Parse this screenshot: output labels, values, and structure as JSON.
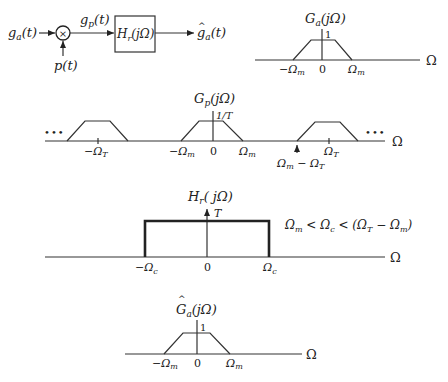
{
  "block_diagram": {
    "input_label": "g",
    "input_sub": "a",
    "input_arg": "(t)",
    "multiplier_symbol": "×",
    "sampling_label": "p(t)",
    "intermediate_label": "g",
    "intermediate_sub": "p",
    "intermediate_arg": "(t)",
    "filter_label": "H",
    "filter_sub": "r",
    "filter_arg": "(jΩ)",
    "output_hat": "^",
    "output_label": "g",
    "output_sub": "a",
    "output_arg": "(t)"
  },
  "spectrum_ga": {
    "title": "G",
    "title_sub": "a",
    "title_arg": "(jΩ)",
    "peak_label": "1",
    "ticks": {
      "neg_label": "−Ω",
      "neg_sub": "m",
      "zero": "0",
      "pos_label": "Ω",
      "pos_sub": "m"
    },
    "axis_label": "Ω"
  },
  "spectrum_gp": {
    "title": "G",
    "title_sub": "p",
    "title_arg": "(jΩ)",
    "peak_label": "1/T",
    "ellipsis_left": "•••",
    "ellipsis_right": "•••",
    "ticks": {
      "neg_t_label": "−Ω",
      "neg_t_sub": "T",
      "neg_m_label": "−Ω",
      "neg_m_sub": "m",
      "zero": "0",
      "pos_m_label": "Ω",
      "pos_m_sub": "m",
      "diff_label": "Ω",
      "diff_sub1": "m",
      "diff_mid": " − Ω",
      "diff_sub2": "T",
      "pos_t_label": "Ω",
      "pos_t_sub": "T"
    },
    "axis_label": "Ω"
  },
  "filter_hr": {
    "title": "H",
    "title_sub": "r",
    "title_arg": "( jΩ)",
    "gain_label": "T",
    "condition": {
      "p1": "Ω",
      "s1": "m",
      "p2": " < Ω",
      "s2": "c",
      "p3": " < (Ω",
      "s3": "T",
      "p4": " − Ω",
      "s4": "m",
      "p5": ")"
    },
    "ticks": {
      "neg_label": "−Ω",
      "neg_sub": "c",
      "zero": "0",
      "pos_label": "Ω",
      "pos_sub": "c"
    },
    "axis_label": "Ω"
  },
  "spectrum_ga_hat": {
    "hat": "^",
    "title": "G",
    "title_sub": "a",
    "title_arg": "(jΩ)",
    "peak_label": "1",
    "ticks": {
      "neg_label": "−Ω",
      "neg_sub": "m",
      "zero": "0",
      "pos_label": "Ω",
      "pos_sub": "m"
    },
    "axis_label": "Ω"
  },
  "colors": {
    "ink": "#222222",
    "background": "#ffffff"
  }
}
